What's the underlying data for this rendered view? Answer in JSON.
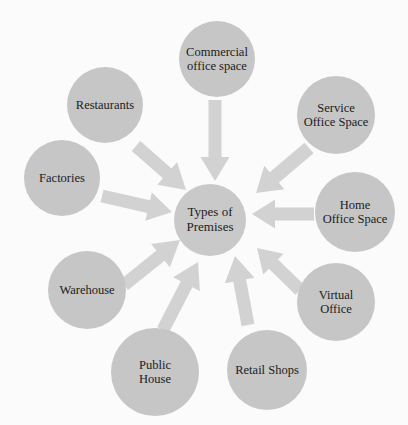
{
  "diagram": {
    "title": "Types of Premises",
    "type": "hub-and-spoke concept map",
    "colors": {
      "background": "#fbfbfb",
      "node_fill": "#c6c6c6",
      "center_fill": "#c9c9c9",
      "arrow_fill": "#d2d2d2",
      "text": "#1c1c1c"
    },
    "center": {
      "label": "Types of\nPremises",
      "cx": 210,
      "cy": 220,
      "r": 36,
      "font_size": 13
    },
    "nodes": [
      {
        "id": "commercial-office-space",
        "label": "Commercial\noffice space",
        "cx": 217,
        "cy": 59,
        "r": 38,
        "font_size": 12.5
      },
      {
        "id": "service-office-space",
        "label": "Service\nOffice Space",
        "cx": 336,
        "cy": 115,
        "r": 39,
        "font_size": 12.5
      },
      {
        "id": "home-office-space",
        "label": "Home\nOffice Space",
        "cx": 355,
        "cy": 212,
        "r": 40,
        "font_size": 12.5
      },
      {
        "id": "virtual-office",
        "label": "Virtual\nOffice",
        "cx": 336,
        "cy": 302,
        "r": 39,
        "font_size": 12.5
      },
      {
        "id": "retail-shops",
        "label": "Retail Shops",
        "cx": 267,
        "cy": 370,
        "r": 40,
        "font_size": 12.5
      },
      {
        "id": "public-house",
        "label": "Public\nHouse",
        "cx": 155,
        "cy": 372,
        "r": 44,
        "font_size": 12.5
      },
      {
        "id": "warehouse",
        "label": "Warehouse",
        "cx": 87,
        "cy": 290,
        "r": 39,
        "font_size": 12.5
      },
      {
        "id": "factories",
        "label": "Factories",
        "cx": 62,
        "cy": 178,
        "r": 38,
        "font_size": 12.5
      },
      {
        "id": "restaurants",
        "label": "Restaurants",
        "cx": 105,
        "cy": 105,
        "r": 38,
        "font_size": 12.5
      }
    ],
    "arrows": [
      {
        "id": "arrow-commercial-office-space",
        "from": "commercial-office-space",
        "to": "center",
        "x1": 215,
        "y1": 100,
        "x2": 215,
        "y2": 181,
        "shaft_width": 13,
        "head_width": 29,
        "head_length": 24
      },
      {
        "id": "arrow-service-office-space",
        "from": "service-office-space",
        "to": "center",
        "x1": 309,
        "y1": 148,
        "x2": 256,
        "y2": 193,
        "shaft_width": 14,
        "head_width": 31,
        "head_length": 24
      },
      {
        "id": "arrow-home-office-space",
        "from": "home-office-space",
        "to": "center",
        "x1": 314,
        "y1": 214,
        "x2": 252,
        "y2": 214,
        "shaft_width": 13,
        "head_width": 29,
        "head_length": 23
      },
      {
        "id": "arrow-virtual-office",
        "from": "virtual-office",
        "to": "center",
        "x1": 300,
        "y1": 290,
        "x2": 257,
        "y2": 248,
        "shaft_width": 13,
        "head_width": 29,
        "head_length": 23
      },
      {
        "id": "arrow-retail-shops",
        "from": "retail-shops",
        "to": "center",
        "x1": 248,
        "y1": 325,
        "x2": 235,
        "y2": 256,
        "shaft_width": 13,
        "head_width": 30,
        "head_length": 25
      },
      {
        "id": "arrow-public-house",
        "from": "public-house",
        "to": "center",
        "x1": 163,
        "y1": 330,
        "x2": 198,
        "y2": 262,
        "shaft_width": 13,
        "head_width": 30,
        "head_length": 25
      },
      {
        "id": "arrow-warehouse",
        "from": "warehouse",
        "to": "center",
        "x1": 124,
        "y1": 285,
        "x2": 180,
        "y2": 240,
        "shaft_width": 13,
        "head_width": 30,
        "head_length": 25
      },
      {
        "id": "arrow-factories",
        "from": "factories",
        "to": "center",
        "x1": 102,
        "y1": 196,
        "x2": 172,
        "y2": 212,
        "shaft_width": 13,
        "head_width": 29,
        "head_length": 24
      },
      {
        "id": "arrow-restaurants",
        "from": "restaurants",
        "to": "center",
        "x1": 136,
        "y1": 146,
        "x2": 186,
        "y2": 190,
        "shaft_width": 13,
        "head_width": 30,
        "head_length": 25
      }
    ]
  }
}
